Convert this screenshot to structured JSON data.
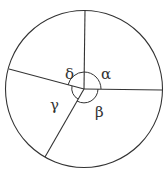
{
  "diagram": {
    "type": "circle-with-radii",
    "center": [
      84,
      89
    ],
    "radius": 78,
    "stroke_color": "#333333",
    "radii_endpoints": [
      [
        85,
        10
      ],
      [
        162,
        90
      ],
      [
        45,
        157
      ],
      [
        9,
        69
      ]
    ],
    "angle_labels": [
      {
        "symbol": "α",
        "x": 101,
        "y": 79
      },
      {
        "symbol": "β",
        "x": 96,
        "y": 116
      },
      {
        "symbol": "γ",
        "x": 50,
        "y": 109
      },
      {
        "symbol": "δ",
        "x": 66,
        "y": 78
      }
    ]
  }
}
